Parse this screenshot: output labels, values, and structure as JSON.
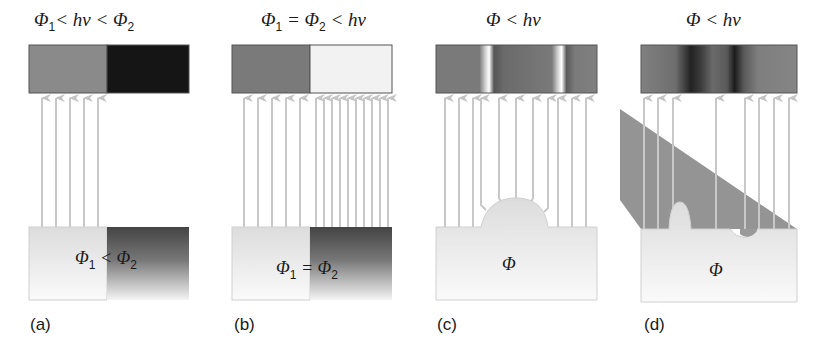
{
  "figure": {
    "panels": [
      {
        "id": "a",
        "label": "(a)",
        "title": {
          "phi1": "Φ",
          "sub1": "1",
          "mid": "< hν < ",
          "phi2": "Φ",
          "sub2": "2"
        },
        "specimen_text": {
          "phi1": "Φ",
          "sub1": "1",
          "op": " < ",
          "phi2": "Φ",
          "sub2": "2"
        },
        "screen": {
          "left_shade": "#8a8a8a",
          "right_shade": "#141414"
        },
        "arrow_count": 5
      },
      {
        "id": "b",
        "label": "(b)",
        "title": {
          "phi1": "Φ",
          "sub1": "1",
          "mid": " = ",
          "phi2": "Φ",
          "sub2": "2",
          "tail": " < hν"
        },
        "specimen_text": {
          "phi1": "Φ",
          "sub1": "1",
          "op": " = ",
          "phi2": "Φ",
          "sub2": "2"
        },
        "screen": {
          "left_shade": "#7a7a7a",
          "right_shade": "#f2f2f2"
        },
        "arrow_count_left": 5,
        "arrow_count_right": 10
      },
      {
        "id": "c",
        "label": "(c)",
        "title": {
          "phi": "Φ",
          "tail": " < hν"
        },
        "specimen_text": {
          "phi": "Φ"
        },
        "screen": {
          "base_shade": "#7c7c7c",
          "bright_bands_x": [
            0.32,
            0.78
          ]
        },
        "arrow_count": 11
      },
      {
        "id": "d",
        "label": "(d)",
        "title": {
          "phi": "Φ",
          "tail": " < hν"
        },
        "specimen_text": {
          "phi": "Φ"
        },
        "screen": {
          "base_shade": "#7c7c7c",
          "dark_bands_x": [
            0.35,
            0.62
          ]
        },
        "arrow_count": 8
      }
    ],
    "colors": {
      "arrow": "#c8c8c8",
      "specimen_light": "#ececec",
      "specimen_dark": "#4a4a4a",
      "shadow_beam": "#8c8c8c",
      "screen_border": "#555555"
    }
  }
}
